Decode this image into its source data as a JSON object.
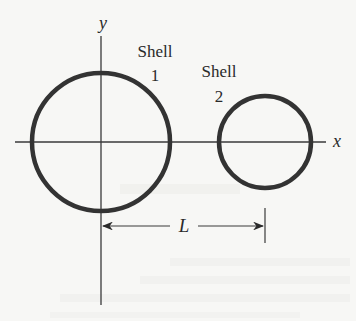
{
  "figure": {
    "type": "physics-diagram",
    "axes": {
      "x_label": "x",
      "y_label": "y",
      "origin": [
        101,
        142
      ]
    },
    "shells": [
      {
        "id": 1,
        "label_word": "Shell",
        "label_number": "1",
        "center": [
          101,
          142
        ],
        "radius": 69
      },
      {
        "id": 2,
        "label_word": "Shell",
        "label_number": "2",
        "center": [
          265,
          142
        ],
        "radius": 46
      }
    ],
    "dimension": {
      "label": "L",
      "from": "center of shell 1",
      "to": "center of shell 2"
    },
    "colors": {
      "shell_stroke": "#333333",
      "axis_stroke": "#3a3a3a",
      "background": "#f7f7f5"
    }
  }
}
